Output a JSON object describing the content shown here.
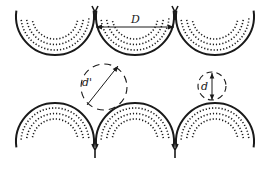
{
  "diagram": {
    "labels": {
      "center_distance": "D",
      "diagonal_gap": "d'",
      "vertical_gap": "d"
    },
    "top_row": {
      "count": 3,
      "orientation": "open-top (U-shaped)",
      "centers_x": [
        55,
        135,
        215
      ],
      "center_y": 16,
      "radius": 39
    },
    "bottom_row": {
      "count": 3,
      "orientation": "open-bottom (arch-shaped)",
      "centers_x": [
        55,
        135,
        215
      ],
      "center_y": 142,
      "radius": 39
    },
    "dotted_rings": 3,
    "gap_circles": [
      {
        "label": "d'",
        "cx": 104,
        "cy": 87,
        "r": 23,
        "style": "dashed"
      },
      {
        "label": "d",
        "cx": 212,
        "cy": 86,
        "r": 14,
        "style": "dashed"
      }
    ],
    "colors": {
      "stroke": "#1a1a1a",
      "background": "#ffffff"
    }
  }
}
